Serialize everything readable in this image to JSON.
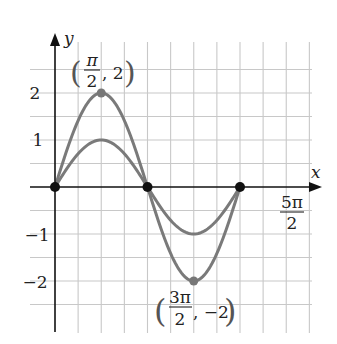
{
  "chart_data": {
    "type": "line",
    "title": "",
    "xlabel": "x",
    "ylabel": "y",
    "x_tick_labels": [
      {
        "value_pi": 2.5,
        "numerator": "5π",
        "denominator": "2"
      }
    ],
    "y_tick_labels": [
      {
        "value": 2,
        "label": "2"
      },
      {
        "value": 1,
        "label": "1"
      },
      {
        "value": -1,
        "label": "−1"
      },
      {
        "value": -2,
        "label": "−2"
      }
    ],
    "xlim_pi": [
      0,
      2.75
    ],
    "ylim": [
      -2.75,
      2.75
    ],
    "grid": true,
    "grid_step_x_pi": 0.25,
    "grid_step_y": 0.5,
    "series": [
      {
        "name": "y = 2 sin x",
        "amplitude": 2,
        "domain_pi": [
          0,
          2
        ],
        "x_pi": [
          0,
          0.25,
          0.5,
          0.75,
          1,
          1.25,
          1.5,
          1.75,
          2
        ],
        "values": [
          0,
          1.414,
          2,
          1.414,
          0,
          -1.414,
          -2,
          -1.414,
          0
        ],
        "color": "#7a7a7a"
      },
      {
        "name": "y = sin x",
        "amplitude": 1,
        "domain_pi": [
          0,
          2
        ],
        "x_pi": [
          0,
          0.25,
          0.5,
          0.75,
          1,
          1.25,
          1.5,
          1.75,
          2
        ],
        "values": [
          0,
          0.707,
          1,
          0.707,
          0,
          -0.707,
          -1,
          -0.707,
          0
        ],
        "color": "#7a7a7a"
      }
    ],
    "points": [
      {
        "x_pi": 0,
        "y": 0,
        "style": "black-dot"
      },
      {
        "x_pi": 1,
        "y": 0,
        "style": "black-dot"
      },
      {
        "x_pi": 2,
        "y": 0,
        "style": "black-dot"
      },
      {
        "x_pi": 0.5,
        "y": 2,
        "style": "gray-dot"
      },
      {
        "x_pi": 1.5,
        "y": -2,
        "style": "gray-dot"
      }
    ],
    "annotations": [
      {
        "text": "(π/2, 2)",
        "open": "(",
        "numerator": "π",
        "denominator": "2",
        "rest": ", 2",
        "close": ")",
        "x_pi": 0.5,
        "y": 2
      },
      {
        "text": "(3π/2, −2)",
        "open": "(",
        "numerator": "3π",
        "denominator": "2",
        "rest": ", −2",
        "close": ")",
        "x_pi": 1.5,
        "y": -2
      }
    ]
  },
  "colors": {
    "axis": "#111111",
    "grid": "#c8c8c8",
    "curve": "#7a7a7a",
    "dot_black": "#111111",
    "dot_gray": "#777777"
  }
}
